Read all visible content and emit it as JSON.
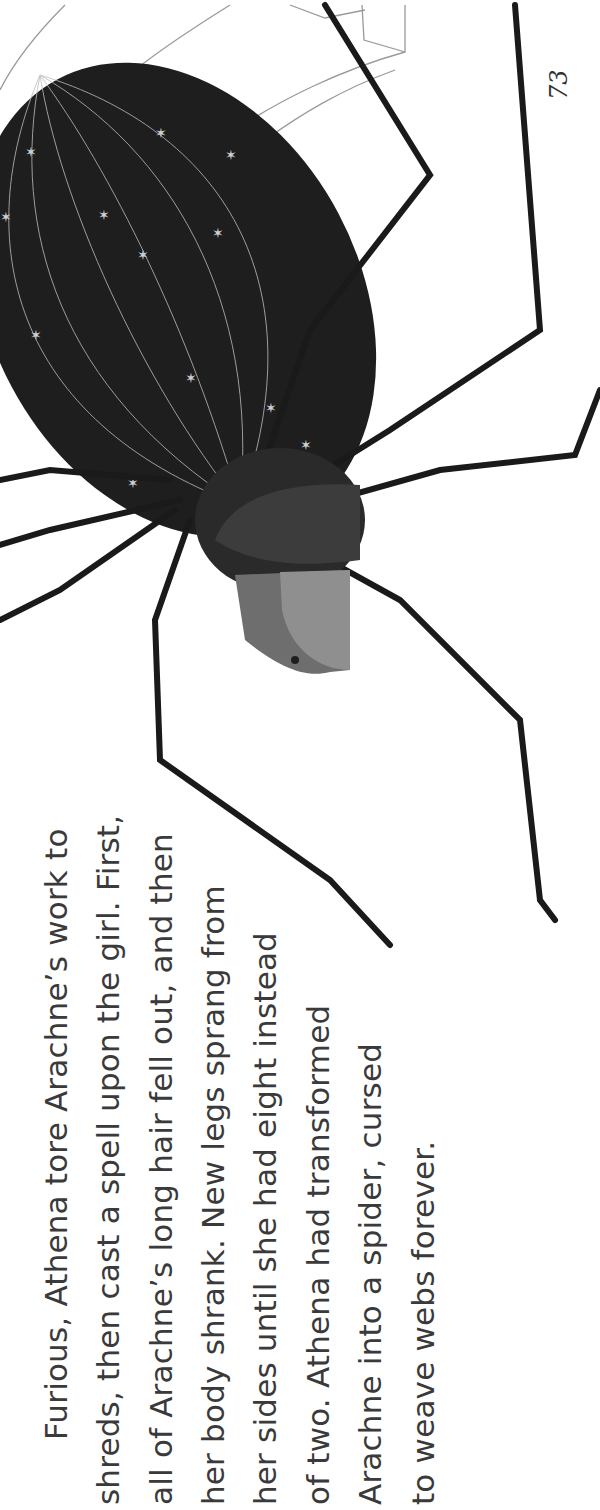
{
  "page": {
    "page_number": "73",
    "orientation": "rotated-90-ccw",
    "illustration": {
      "subject": "Arachne transformed into a spider with a woman's face, hanging from a web",
      "colors": {
        "body": "#1e1e1e",
        "face": "#8a8a8a",
        "hair": "#3a3a3a",
        "web": "#9a9a9a",
        "stars": "#c8c8c8"
      }
    },
    "paragraph": {
      "lines": [
        "Furious, Athena tore Arachne’s work to",
        "shreds, then cast a spell upon the girl. First,",
        "all of Arachne’s long hair fell out, and then",
        "her body shrank. New legs sprang from",
        "her sides until she had eight instead",
        "of two. Athena had transformed",
        "Arachne into a spider, cursed",
        "to weave webs forever."
      ]
    }
  }
}
